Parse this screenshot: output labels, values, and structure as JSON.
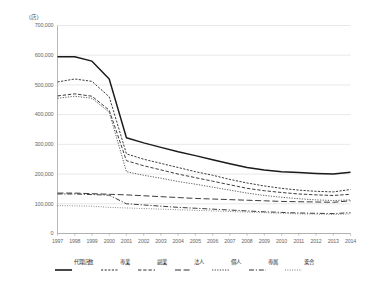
{
  "unit_label": "(店)",
  "chart_data": {
    "type": "line",
    "title": "",
    "subtitle": "",
    "xlabel": "",
    "ylabel": "",
    "unit": "店",
    "grid": true,
    "legend_position": "bottom",
    "ylim": [
      0,
      700000
    ],
    "ytick_labels": [
      "700,000",
      "600,000",
      "500,000",
      "400,000",
      "300,000",
      "200,000",
      "100,000",
      "0"
    ],
    "yticks": [
      700000,
      600000,
      500000,
      400000,
      300000,
      200000,
      100000,
      0
    ],
    "categories": [
      "1997",
      "1998",
      "1999",
      "2000",
      "2001",
      "2002",
      "2003",
      "2004",
      "2005",
      "2006",
      "2007",
      "2008",
      "2009",
      "2010",
      "2011",
      "2012",
      "2013",
      "2014"
    ],
    "x": [
      1997,
      1998,
      1999,
      2000,
      2001,
      2002,
      2003,
      2004,
      2005,
      2006,
      2007,
      2008,
      2009,
      2010,
      2011,
      2012,
      2013,
      2014
    ],
    "series": [
      {
        "name": "代理店数",
        "style": "solid",
        "color": "#1a1a1a",
        "values": [
          595000,
          595000,
          580000,
          520000,
          322000,
          305000,
          290000,
          275000,
          262000,
          248000,
          235000,
          222000,
          214000,
          208000,
          205000,
          202000,
          200000,
          206000
        ]
      },
      {
        "name": "専業",
        "style": "dotted",
        "color": "#333333",
        "values": [
          510000,
          520000,
          512000,
          460000,
          268000,
          250000,
          236000,
          222000,
          208000,
          196000,
          182000,
          170000,
          160000,
          152000,
          146000,
          142000,
          140000,
          148000
        ]
      },
      {
        "name": "副業",
        "style": "dashed",
        "color": "#333333",
        "values": [
          463000,
          470000,
          462000,
          415000,
          245000,
          228000,
          214000,
          200000,
          188000,
          176000,
          164000,
          152000,
          144000,
          138000,
          133000,
          130000,
          128000,
          132000
        ]
      },
      {
        "name": "法人",
        "style": "long-dash",
        "color": "#333333",
        "values": [
          136000,
          136000,
          134000,
          132000,
          130000,
          127000,
          124000,
          121000,
          118000,
          116000,
          114000,
          112000,
          110000,
          108000,
          107000,
          106000,
          105000,
          110000
        ]
      },
      {
        "name": "個人",
        "style": "dashed-fine",
        "color": "#333333",
        "values": [
          455000,
          462000,
          455000,
          408000,
          208000,
          196000,
          186000,
          175000,
          166000,
          156000,
          146000,
          136000,
          128000,
          122000,
          117000,
          113000,
          111000,
          113000
        ]
      },
      {
        "name": "専属",
        "style": "dash-dot",
        "color": "#333333",
        "values": [
          133000,
          133000,
          131000,
          129000,
          100000,
          96000,
          92000,
          88000,
          85000,
          82000,
          79000,
          76000,
          73000,
          71000,
          69000,
          68000,
          67000,
          70000
        ]
      },
      {
        "name": "乗合",
        "style": "dash-dot-fine",
        "color": "#555555",
        "values": [
          94000,
          93000,
          92000,
          88000,
          86000,
          84000,
          82000,
          80000,
          78000,
          76000,
          74000,
          72000,
          70000,
          68000,
          66000,
          65000,
          64000,
          66000
        ]
      }
    ]
  }
}
